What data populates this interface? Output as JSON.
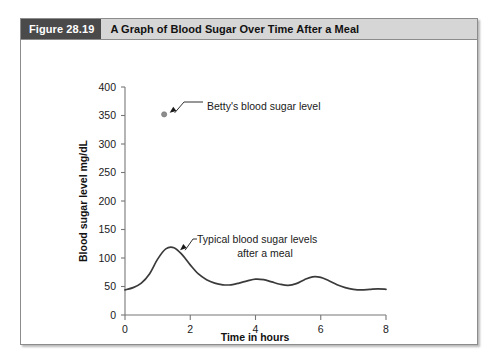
{
  "figure": {
    "number_label": "Figure 28.19",
    "title": "A Graph of Blood Sugar Over Time After a Meal"
  },
  "chart_data": {
    "type": "line",
    "title": "A Graph of Blood Sugar Over Time After a Meal",
    "xlabel": "Time in hours",
    "ylabel": "Blood sugar level mg/dL",
    "xlim": [
      0,
      8
    ],
    "ylim": [
      0,
      400
    ],
    "xticks": [
      0,
      2,
      4,
      6,
      8
    ],
    "xtick_labels": [
      "0",
      "2",
      "4",
      "6",
      "8"
    ],
    "yticks": [
      0,
      50,
      100,
      150,
      200,
      250,
      300,
      350,
      400
    ],
    "ytick_labels": [
      "0",
      "50",
      "100",
      "150",
      "200",
      "250",
      "300",
      "350",
      "400"
    ],
    "grid": false,
    "legend": "none",
    "series": [
      {
        "name": "Typical blood sugar levels after a meal",
        "kind": "line",
        "x": [
          0.0,
          0.25,
          0.5,
          0.75,
          1.0,
          1.25,
          1.5,
          1.75,
          2.0,
          2.25,
          2.5,
          2.75,
          3.0,
          3.25,
          3.5,
          3.75,
          4.0,
          4.25,
          4.5,
          4.75,
          5.0,
          5.25,
          5.5,
          5.75,
          6.0,
          6.25,
          6.5,
          6.75,
          7.0,
          7.25,
          7.5,
          7.75,
          8.0
        ],
        "values": [
          44,
          48,
          56,
          72,
          98,
          116,
          118,
          106,
          88,
          72,
          62,
          56,
          53,
          53,
          56,
          60,
          63,
          62,
          58,
          54,
          52,
          55,
          62,
          67,
          66,
          60,
          53,
          48,
          45,
          44,
          45,
          46,
          45
        ]
      },
      {
        "name": "Betty's blood sugar level",
        "kind": "point",
        "x": [
          1.2
        ],
        "values": [
          352
        ]
      }
    ],
    "annotations": [
      {
        "id": "betty-annotation",
        "text": "Betty's blood sugar level",
        "points_to_series": "Betty's blood sugar level",
        "target_x": 1.2,
        "target_y": 352
      },
      {
        "id": "typical-annotation",
        "text_line_1": "Typical blood sugar levels",
        "text_line_2": "after a meal",
        "points_to_series": "Typical blood sugar levels after a meal",
        "target_x": 1.55,
        "target_y": 118
      }
    ],
    "colors": {
      "curve": "#3a3a3a",
      "point": "#8d8d8d",
      "axis": "#777777",
      "caption_block": "#4a4a4a",
      "caption_band": "#d6d6d6",
      "text": "#1a1a1a"
    }
  }
}
